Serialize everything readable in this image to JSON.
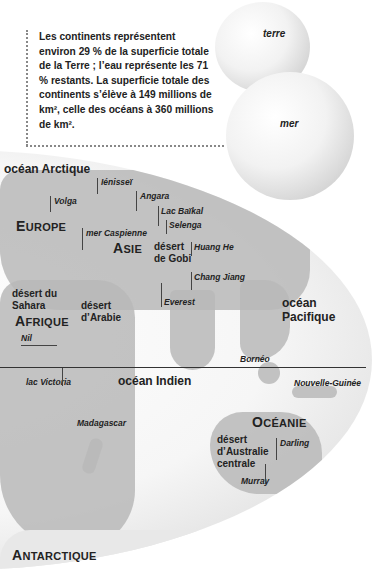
{
  "info": {
    "text": "Les continents représentent environ 29 % de la superficie totale de la Terre ; l’eau représente les 71 % restants. La superficie totale des continents s’élève à 149 millions de km², celle des océans à 360 millions de km²."
  },
  "globes": {
    "land_label": "terre",
    "sea_label": "mer"
  },
  "map": {
    "oceans": {
      "arctic": "océan Arctique",
      "indian": "océan Indien",
      "pacific_line1": "océan",
      "pacific_line2": "Pacifique"
    },
    "continents": {
      "europe_cap": "E",
      "europe_rest": "UROPE",
      "asia_cap": "A",
      "asia_rest": "SIE",
      "africa_cap": "A",
      "africa_rest": "FRIQUE",
      "oceania_cap": "O",
      "oceania_rest": "CÉANIE",
      "antarctica_cap": "A",
      "antarctica_rest": "NTARCTIQUE"
    },
    "features": {
      "yenisei": "Iénisseï",
      "angara": "Angara",
      "volga": "Volga",
      "baikal": "Lac Baïkal",
      "selenga": "Selenga",
      "caspian": "mer Caspienne",
      "huang_he": "Huang He",
      "chang_jiang": "Chang Jiang",
      "everest": "Everest",
      "nil": "Nil",
      "victoria": "lac Victoria",
      "madagascar": "Madagascar",
      "borneo": "Bornéo",
      "new_guinea": "Nouvelle-Guinée",
      "darling": "Darling",
      "murray": "Murray"
    },
    "deserts": {
      "gobi": "désert\nde Gobi",
      "sahara": "désert du\nSahara",
      "arabia": "désert\nd’Arabie",
      "australia": "désert\nd’Australie\ncentrale"
    }
  }
}
